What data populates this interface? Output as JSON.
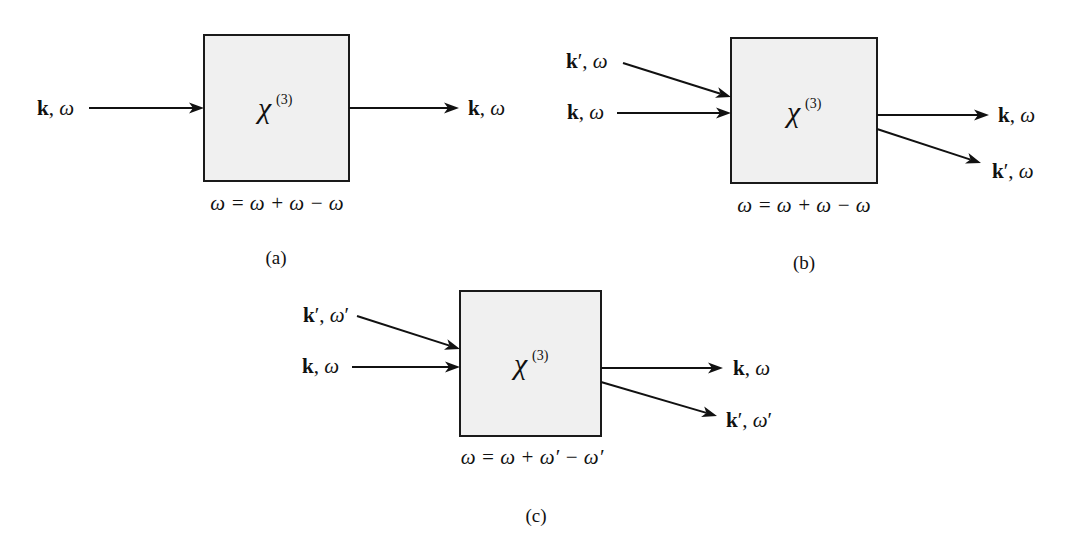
{
  "figure": {
    "background": "#ffffff",
    "box_fill": "#f0f0f0",
    "stroke_color": "#111111"
  },
  "panels": [
    {
      "id": "a",
      "caption": "(a)",
      "susceptibility": {
        "symbol": "χ",
        "order": "(3)"
      },
      "equation": "ω = ω + ω − ω",
      "box": {
        "x": 204,
        "y": 35,
        "w": 145,
        "h": 146
      },
      "chi_pos": {
        "x": 258,
        "y": 118
      },
      "equation_pos": {
        "x": 277,
        "y": 210
      },
      "caption_pos": {
        "x": 276,
        "y": 264
      },
      "inputs": [
        {
          "wavevector": "k",
          "prime_k": false,
          "frequency": "ω",
          "prime_w": false,
          "label_x": 37,
          "label_y": 115,
          "x1": 89,
          "y1": 108,
          "x2": 204,
          "y2": 108
        }
      ],
      "outputs": [
        {
          "wavevector": "k",
          "prime_k": false,
          "frequency": "ω",
          "prime_w": false,
          "label_x": 468,
          "label_y": 115,
          "x1": 349,
          "y1": 108,
          "x2": 459,
          "y2": 108
        }
      ]
    },
    {
      "id": "b",
      "caption": "(b)",
      "susceptibility": {
        "symbol": "χ",
        "order": "(3)"
      },
      "equation": "ω = ω + ω − ω",
      "box": {
        "x": 731,
        "y": 38,
        "w": 146,
        "h": 145
      },
      "chi_pos": {
        "x": 787,
        "y": 122
      },
      "equation_pos": {
        "x": 804,
        "y": 212
      },
      "caption_pos": {
        "x": 804,
        "y": 269
      },
      "inputs": [
        {
          "wavevector": "k",
          "prime_k": true,
          "frequency": "ω",
          "prime_w": false,
          "label_x": 566,
          "label_y": 68,
          "x1": 623,
          "y1": 63,
          "x2": 731,
          "y2": 97
        },
        {
          "wavevector": "k",
          "prime_k": false,
          "frequency": "ω",
          "prime_w": false,
          "label_x": 567,
          "label_y": 119,
          "x1": 617,
          "y1": 113,
          "x2": 731,
          "y2": 113
        }
      ],
      "outputs": [
        {
          "wavevector": "k",
          "prime_k": false,
          "frequency": "ω",
          "prime_w": false,
          "label_x": 998,
          "label_y": 122,
          "x1": 877,
          "y1": 115,
          "x2": 989,
          "y2": 115
        },
        {
          "wavevector": "k",
          "prime_k": true,
          "frequency": "ω",
          "prime_w": false,
          "label_x": 992,
          "label_y": 178,
          "x1": 877,
          "y1": 129,
          "x2": 981,
          "y2": 163
        }
      ]
    },
    {
      "id": "c",
      "caption": "(c)",
      "susceptibility": {
        "symbol": "χ",
        "order": "(3)"
      },
      "equation": "ω = ω + ω′ − ω′",
      "box": {
        "x": 460,
        "y": 291,
        "w": 141,
        "h": 145
      },
      "chi_pos": {
        "x": 514,
        "y": 374
      },
      "equation_pos": {
        "x": 532,
        "y": 464
      },
      "caption_pos": {
        "x": 536,
        "y": 522
      },
      "inputs": [
        {
          "wavevector": "k",
          "prime_k": true,
          "frequency": "ω",
          "prime_w": true,
          "label_x": 303,
          "label_y": 322,
          "x1": 357,
          "y1": 316,
          "x2": 460,
          "y2": 349
        },
        {
          "wavevector": "k",
          "prime_k": false,
          "frequency": "ω",
          "prime_w": false,
          "label_x": 302,
          "label_y": 373,
          "x1": 352,
          "y1": 367,
          "x2": 460,
          "y2": 367
        }
      ],
      "outputs": [
        {
          "wavevector": "k",
          "prime_k": false,
          "frequency": "ω",
          "prime_w": false,
          "label_x": 733,
          "label_y": 375,
          "x1": 601,
          "y1": 368,
          "x2": 723,
          "y2": 368
        },
        {
          "wavevector": "k",
          "prime_k": true,
          "frequency": "ω",
          "prime_w": true,
          "label_x": 726,
          "label_y": 427,
          "x1": 601,
          "y1": 382,
          "x2": 717,
          "y2": 416
        }
      ]
    }
  ]
}
